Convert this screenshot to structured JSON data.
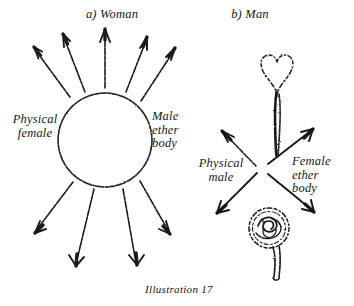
{
  "figure": {
    "caption": "Illustration 17",
    "background_color": "#ffffff",
    "ink_color": "#1a1a1a",
    "panels": [
      {
        "id": "woman",
        "title": "a) Woman",
        "labels": [
          {
            "id": "physical-female",
            "text": "Physical\nfemale"
          },
          {
            "id": "male-ether-body",
            "text": "Male\nether\nbody"
          }
        ],
        "shapes": [
          {
            "name": "physical-body-circle",
            "type": "circle",
            "cx": 105,
            "cy": 140,
            "r": 47
          }
        ],
        "arrows": [
          {
            "name": "arrow-up-outward-1",
            "x1": 70,
            "y1": 97,
            "x2": 33,
            "y2": 47
          },
          {
            "name": "arrow-up-outward-2",
            "x1": 85,
            "y1": 91,
            "x2": 62,
            "y2": 34
          },
          {
            "name": "arrow-up-outward-3",
            "x1": 105,
            "y1": 88,
            "x2": 105,
            "y2": 29
          },
          {
            "name": "arrow-up-outward-4",
            "x1": 126,
            "y1": 92,
            "x2": 147,
            "y2": 37
          },
          {
            "name": "arrow-up-outward-5",
            "x1": 141,
            "y1": 100,
            "x2": 174,
            "y2": 48
          },
          {
            "name": "arrow-down-outward-1",
            "x1": 72,
            "y1": 181,
            "x2": 34,
            "y2": 233
          },
          {
            "name": "arrow-down-outward-2",
            "x1": 93,
            "y1": 189,
            "x2": 75,
            "y2": 266
          },
          {
            "name": "arrow-down-outward-3",
            "x1": 123,
            "y1": 188,
            "x2": 137,
            "y2": 265
          },
          {
            "name": "arrow-down-outward-4",
            "x1": 140,
            "y1": 180,
            "x2": 170,
            "y2": 234
          }
        ]
      },
      {
        "id": "man",
        "title": "b) Man",
        "labels": [
          {
            "id": "physical-male",
            "text": "Physical\nmale"
          },
          {
            "id": "female-ether-body",
            "text": "Female\nether\nbody"
          }
        ],
        "shapes": [
          {
            "name": "heart-sperm-shape",
            "type": "heart-with-tail",
            "cx": 277,
            "cy": 78
          },
          {
            "name": "ovum-scribble-shape",
            "type": "scribble-circle-with-stem",
            "cx": 270,
            "cy": 230
          }
        ],
        "arrows": [
          {
            "name": "arrow-upper-left",
            "x1": 256,
            "y1": 165,
            "x2": 222,
            "y2": 131
          },
          {
            "name": "arrow-upper-right",
            "x1": 267,
            "y1": 163,
            "x2": 313,
            "y2": 129
          },
          {
            "name": "arrow-lower-left",
            "x1": 257,
            "y1": 172,
            "x2": 217,
            "y2": 213
          },
          {
            "name": "arrow-lower-right",
            "x1": 268,
            "y1": 173,
            "x2": 314,
            "y2": 212
          }
        ]
      }
    ]
  }
}
